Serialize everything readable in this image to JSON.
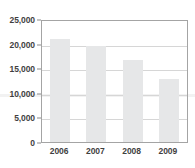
{
  "chart_data": {
    "type": "bar",
    "title": "",
    "subtitle": "",
    "xlabel": "",
    "ylabel": "",
    "categories": [
      "2006",
      "2007",
      "2008",
      "2009"
    ],
    "values": [
      21200,
      19900,
      17000,
      13000
    ],
    "ylim": [
      0,
      25000
    ],
    "ytick_labels": [
      "25,000",
      "20,000",
      "15,000",
      "10,000",
      "5,000",
      "0"
    ],
    "ytick_values": [
      25000,
      20000,
      15000,
      10000,
      5000,
      0
    ],
    "grid": true,
    "legend": false,
    "legend_position": "none",
    "annotations": [],
    "colors": {
      "bar_fill": "#e6e7e8",
      "plot_border": "#a4a4a4",
      "gridline": "#d6d6d6",
      "tick_label": "#3f3f3f",
      "background": "#ffffff"
    }
  }
}
